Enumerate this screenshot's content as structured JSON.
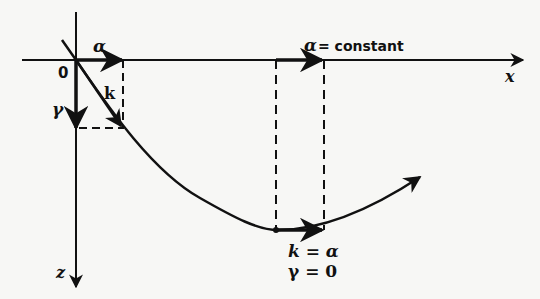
{
  "diagram": {
    "labels": {
      "alpha": "α",
      "origin": "0",
      "k": "k",
      "gamma": "γ",
      "alpha_constant_symbol": "α",
      "alpha_constant_text": "= constant",
      "x_axis": "x",
      "z_axis": "z",
      "k_eq_alpha": "k = α",
      "gamma_eq_zero": "γ = 0"
    },
    "colors": {
      "background": "#f7f7f5",
      "ink": "#111111"
    }
  }
}
